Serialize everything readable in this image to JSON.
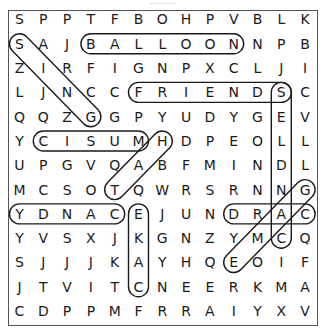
{
  "puzzle": {
    "rows": 13,
    "cols": 13,
    "grid": [
      [
        "S",
        "P",
        "P",
        "T",
        "F",
        "B",
        "O",
        "H",
        "P",
        "V",
        "B",
        "L",
        "K"
      ],
      [
        "S",
        "A",
        "J",
        "B",
        "A",
        "L",
        "L",
        "O",
        "O",
        "N",
        "N",
        "P",
        "B"
      ],
      [
        "Z",
        "I",
        "R",
        "F",
        "I",
        "G",
        "N",
        "P",
        "X",
        "C",
        "L",
        "J",
        "I"
      ],
      [
        "L",
        "J",
        "N",
        "C",
        "C",
        "F",
        "R",
        "I",
        "E",
        "N",
        "D",
        "S",
        "C"
      ],
      [
        "Q",
        "Q",
        "Z",
        "G",
        "G",
        "P",
        "Y",
        "U",
        "D",
        "Y",
        "G",
        "E",
        "V"
      ],
      [
        "Y",
        "C",
        "I",
        "S",
        "U",
        "M",
        "H",
        "D",
        "P",
        "E",
        "O",
        "L",
        "L"
      ],
      [
        "U",
        "P",
        "G",
        "V",
        "Q",
        "A",
        "B",
        "F",
        "M",
        "I",
        "N",
        "D",
        "L"
      ],
      [
        "M",
        "C",
        "S",
        "O",
        "T",
        "Q",
        "W",
        "R",
        "S",
        "R",
        "N",
        "N",
        "G"
      ],
      [
        "Y",
        "D",
        "N",
        "A",
        "C",
        "E",
        "J",
        "U",
        "N",
        "D",
        "R",
        "A",
        "C"
      ],
      [
        "Y",
        "V",
        "S",
        "X",
        "J",
        "K",
        "G",
        "N",
        "Z",
        "Y",
        "M",
        "C",
        "Q"
      ],
      [
        "S",
        "J",
        "J",
        "J",
        "K",
        "A",
        "Y",
        "H",
        "Q",
        "E",
        "O",
        "I",
        "F"
      ],
      [
        "J",
        "T",
        "V",
        "I",
        "T",
        "C",
        "N",
        "E",
        "E",
        "R",
        "K",
        "M",
        "A"
      ],
      [
        "C",
        "D",
        "P",
        "P",
        "M",
        "F",
        "R",
        "R",
        "A",
        "I",
        "Y",
        "X",
        "V"
      ]
    ],
    "found_words": [
      {
        "word": "BALLOON",
        "start": [
          1,
          3
        ],
        "end": [
          1,
          9
        ]
      },
      {
        "word": "FRIENDS",
        "start": [
          3,
          5
        ],
        "end": [
          3,
          11
        ]
      },
      {
        "word": "CANDLES",
        "start": [
          9,
          11
        ],
        "end": [
          3,
          11
        ]
      },
      {
        "word": "SING",
        "start": [
          1,
          0
        ],
        "end": [
          4,
          3
        ]
      },
      {
        "word": "MUSIC",
        "start": [
          5,
          5
        ],
        "end": [
          5,
          1
        ]
      },
      {
        "word": "HAT",
        "start": [
          5,
          6
        ],
        "end": [
          7,
          4
        ]
      },
      {
        "word": "CANDY",
        "start": [
          8,
          4
        ],
        "end": [
          8,
          0
        ]
      },
      {
        "word": "CAKE",
        "start": [
          11,
          5
        ],
        "end": [
          8,
          5
        ]
      },
      {
        "word": "CARD",
        "start": [
          8,
          12
        ],
        "end": [
          8,
          9
        ]
      },
      {
        "word": "GAME",
        "start": [
          7,
          12
        ],
        "end": [
          10,
          9
        ]
      }
    ]
  },
  "colors": {
    "loop": "#1a1a1a",
    "text": "#1a1a1a",
    "border": "#555555"
  }
}
